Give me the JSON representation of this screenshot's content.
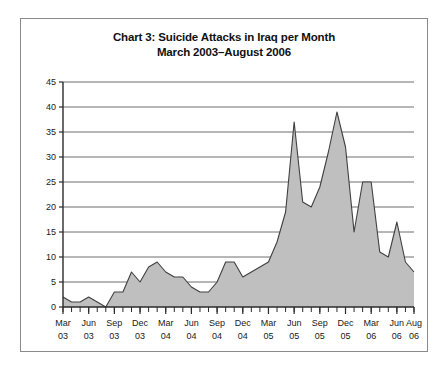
{
  "chart_data": {
    "type": "area",
    "title": "Chart 3: Suicide Attacks in Iraq per Month",
    "subtitle": "March 2003–August 2006",
    "title_lines": [
      "Chart 3: Suicide Attacks in Iraq per Month",
      "March 2003–August 2006"
    ],
    "xlabel": "",
    "ylabel": "",
    "ylim": [
      0,
      45
    ],
    "ytick_values": [
      0,
      5,
      10,
      15,
      20,
      25,
      30,
      35,
      40,
      45
    ],
    "ytick_labels": [
      "0",
      "5",
      "10",
      "15",
      "20",
      "25",
      "30",
      "35",
      "40",
      "45"
    ],
    "grid": true,
    "grid_axis": "y",
    "legend": false,
    "legend_position": "none",
    "minor_tick_interval_months": 1,
    "major_tick_interval_months": 3,
    "xtick_labels": [
      {
        "line1": "Mar",
        "line2": "03",
        "index": 0
      },
      {
        "line1": "Jun",
        "line2": "03",
        "index": 3
      },
      {
        "line1": "Sep",
        "line2": "03",
        "index": 6
      },
      {
        "line1": "Dec",
        "line2": "03",
        "index": 9
      },
      {
        "line1": "Mar",
        "line2": "04",
        "index": 12
      },
      {
        "line1": "Jun",
        "line2": "04",
        "index": 15
      },
      {
        "line1": "Sep",
        "line2": "04",
        "index": 18
      },
      {
        "line1": "Dec",
        "line2": "04",
        "index": 21
      },
      {
        "line1": "Mar",
        "line2": "05",
        "index": 24
      },
      {
        "line1": "Jun",
        "line2": "05",
        "index": 27
      },
      {
        "line1": "Sep",
        "line2": "05",
        "index": 30
      },
      {
        "line1": "Dec",
        "line2": "05",
        "index": 33
      },
      {
        "line1": "Mar",
        "line2": "06",
        "index": 36
      },
      {
        "line1": "Jun",
        "line2": "06",
        "index": 39
      },
      {
        "line1": "Aug",
        "line2": "06",
        "index": 41
      }
    ],
    "categories": [
      "Mar 03",
      "Apr 03",
      "May 03",
      "Jun 03",
      "Jul 03",
      "Aug 03",
      "Sep 03",
      "Oct 03",
      "Nov 03",
      "Dec 03",
      "Jan 04",
      "Feb 04",
      "Mar 04",
      "Apr 04",
      "May 04",
      "Jun 04",
      "Jul 04",
      "Aug 04",
      "Sep 04",
      "Oct 04",
      "Nov 04",
      "Dec 04",
      "Jan 05",
      "Feb 05",
      "Mar 05",
      "Apr 05",
      "May 05",
      "Jun 05",
      "Jul 05",
      "Aug 05",
      "Sep 05",
      "Oct 05",
      "Nov 05",
      "Dec 05",
      "Jan 06",
      "Feb 06",
      "Mar 06",
      "Apr 06",
      "May 06",
      "Jun 06",
      "Jul 06",
      "Aug 06"
    ],
    "values": [
      2,
      1,
      1,
      2,
      1,
      0,
      3,
      3,
      7,
      5,
      8,
      9,
      7,
      6,
      6,
      4,
      3,
      3,
      5,
      9,
      9,
      6,
      7,
      8,
      9,
      13,
      19,
      37,
      21,
      20,
      24,
      31,
      39,
      32,
      15,
      25,
      25,
      11,
      10,
      17,
      9,
      7
    ],
    "series": [
      {
        "name": "Suicide attacks per month",
        "values": [
          2,
          1,
          1,
          2,
          1,
          0,
          3,
          3,
          7,
          5,
          8,
          9,
          7,
          6,
          6,
          4,
          3,
          3,
          5,
          9,
          9,
          6,
          7,
          8,
          9,
          13,
          19,
          37,
          21,
          20,
          24,
          31,
          39,
          32,
          15,
          25,
          25,
          11,
          10,
          17,
          9,
          7
        ]
      }
    ],
    "colors": {
      "area_fill": "#bfbfbf",
      "area_stroke": "#404040",
      "grid": "#6e6e6e",
      "axis": "#2b2b2b",
      "text": "#1a1a1a",
      "frame": "#8a8a8a",
      "background": "#ffffff"
    },
    "annotations": []
  }
}
